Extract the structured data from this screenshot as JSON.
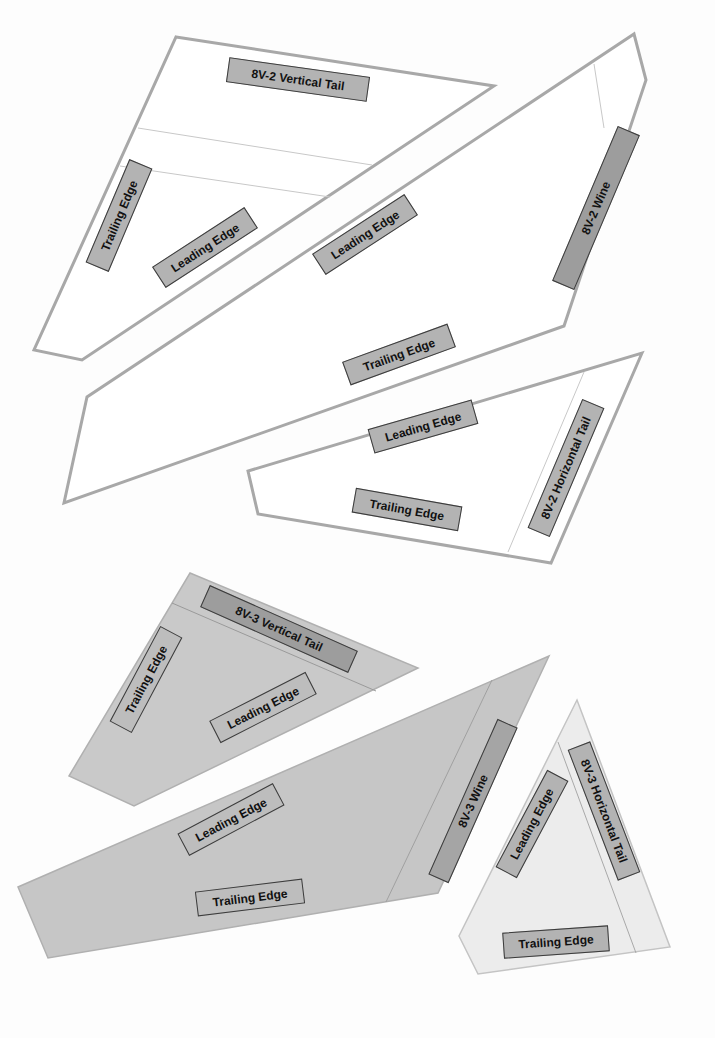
{
  "sheet_8v2": {
    "vertical_tail": {
      "title": "8V-2 Vertical Tail",
      "trailing": "Trailing Edge",
      "leading": "Leading Edge"
    },
    "wing": {
      "title": "8V-2 Wine",
      "leading": "Leading Edge",
      "trailing": "Trailing Edge"
    },
    "horizontal_tail": {
      "title": "8V-2 Horizontal Tail",
      "leading": "Leading Edge",
      "trailing": "Trailing Edge"
    }
  },
  "sheet_8v3": {
    "vertical_tail": {
      "title": "8V-3 Vertical Tail",
      "trailing": "Trailing Edge",
      "leading": "Leading Edge"
    },
    "wing": {
      "title": "8V-3 Wine",
      "leading": "Leading Edge",
      "trailing": "Trailing Edge"
    },
    "horizontal_tail": {
      "title": "8V-3 Horizontal Tail",
      "leading": "Leading Edge",
      "trailing": "Trailing Edge"
    }
  },
  "colors": {
    "paper_white": "#ffffff",
    "outline_gray": "#a8a8a8",
    "cardstock_gray": "#c9c9c9",
    "cardstock_light": "#ececec",
    "label_gray": "#b3b3b3"
  }
}
